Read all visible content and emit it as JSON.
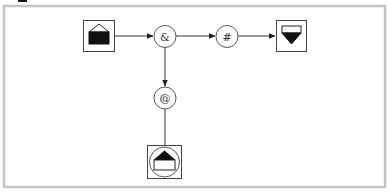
{
  "diagram": {
    "type": "flow-network",
    "colors": {
      "frame": "#c4c4c4",
      "edge": "#333333",
      "node_stroke": "#444444",
      "glyph_fill": "#111111"
    },
    "nodes": [
      {
        "id": "source",
        "shape": "box",
        "glyph": "house-half-filled-icon",
        "label": ""
      },
      {
        "id": "and",
        "shape": "circle",
        "label": "&"
      },
      {
        "id": "hash",
        "shape": "circle",
        "label": "#"
      },
      {
        "id": "sink",
        "shape": "box",
        "glyph": "funnel-down-icon",
        "label": ""
      },
      {
        "id": "at",
        "shape": "circle",
        "label": "@"
      },
      {
        "id": "target",
        "shape": "box-circle",
        "glyph": "house-up-icon",
        "label": ""
      }
    ],
    "edges": [
      {
        "from": "source",
        "to": "and"
      },
      {
        "from": "and",
        "to": "hash"
      },
      {
        "from": "hash",
        "to": "sink"
      },
      {
        "from": "and",
        "to": "at"
      },
      {
        "from": "at",
        "to": "target"
      }
    ]
  }
}
